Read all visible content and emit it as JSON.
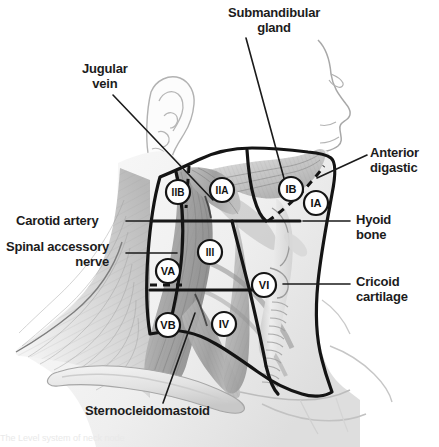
{
  "figure": {
    "background_color": "#ffffff",
    "ink_color": "#1a1a1a",
    "label_text_color": "#1c1c1c",
    "width": 439,
    "height": 447
  },
  "callouts": [
    {
      "name": "submandibular-gland",
      "lines": [
        "Submandibular",
        "gland"
      ],
      "align": "center",
      "x": 228,
      "y": 6,
      "leader": {
        "x1": 246,
        "y1": 38,
        "x2": 285,
        "y2": 182
      }
    },
    {
      "name": "jugular-vein",
      "lines": [
        "Jugular",
        "vein"
      ],
      "align": "center",
      "x": 82,
      "y": 62,
      "leader": {
        "x1": 113,
        "y1": 95,
        "x2": 213,
        "y2": 200
      }
    },
    {
      "name": "anterior-digastic",
      "lines": [
        "Anterior",
        "digastic"
      ],
      "align": "left",
      "x": 370,
      "y": 146,
      "leader": {
        "x1": 367,
        "y1": 155,
        "x2": 317,
        "y2": 178
      }
    },
    {
      "name": "carotid-artery",
      "lines": [
        "Carotid artery"
      ],
      "align": "right",
      "x": 16,
      "y": 214,
      "leader": {
        "x1": 126,
        "y1": 221,
        "x2": 235,
        "y2": 221
      }
    },
    {
      "name": "hyoid-bone",
      "lines": [
        "Hyoid",
        "bone"
      ],
      "align": "left",
      "x": 356,
      "y": 213,
      "leader": {
        "x1": 350,
        "y1": 221,
        "x2": 303,
        "y2": 221
      }
    },
    {
      "name": "spinal-accessory-nerve",
      "lines": [
        "Spinal accessory",
        "nerve"
      ],
      "align": "right",
      "x": 6,
      "y": 240,
      "leader": {
        "x1": 126,
        "y1": 253,
        "x2": 177,
        "y2": 253
      }
    },
    {
      "name": "cricoid-cartilage",
      "lines": [
        "Cricoid",
        "cartilage"
      ],
      "align": "left",
      "x": 356,
      "y": 275,
      "leader": {
        "x1": 350,
        "y1": 284,
        "x2": 283,
        "y2": 284
      }
    },
    {
      "name": "sternocleidomastoid",
      "lines": [
        "Sternocleidomastoid"
      ],
      "align": "center",
      "x": 85,
      "y": 404,
      "leader": {
        "x1": 163,
        "y1": 403,
        "x2": 195,
        "y2": 313
      }
    }
  ],
  "level_markers": [
    {
      "name": "level-IIB",
      "label": "IIB",
      "cx": 178,
      "cy": 192,
      "r": 12
    },
    {
      "name": "level-IIA",
      "label": "IIA",
      "cx": 222,
      "cy": 190,
      "r": 12
    },
    {
      "name": "level-IB",
      "label": "IB",
      "cx": 291,
      "cy": 189,
      "r": 12
    },
    {
      "name": "level-IA",
      "label": "IA",
      "cx": 316,
      "cy": 203,
      "r": 12
    },
    {
      "name": "level-III",
      "label": "III",
      "cx": 210,
      "cy": 252,
      "r": 12
    },
    {
      "name": "level-VA",
      "label": "VA",
      "cx": 168,
      "cy": 271,
      "r": 12
    },
    {
      "name": "level-VI",
      "label": "VI",
      "cx": 264,
      "cy": 285,
      "r": 12
    },
    {
      "name": "level-VB",
      "label": "VB",
      "cx": 168,
      "cy": 325,
      "r": 12
    },
    {
      "name": "level-IV",
      "label": "IV",
      "cx": 224,
      "cy": 324,
      "r": 12
    }
  ],
  "caption_partial": "The Level system of neck node"
}
